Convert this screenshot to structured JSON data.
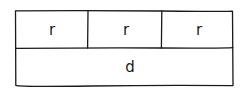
{
  "diagram": {
    "type": "hand-drawn table layout",
    "top_row": {
      "cells": [
        {
          "label": "r"
        },
        {
          "label": "r"
        },
        {
          "label": "r"
        }
      ]
    },
    "bottom_row": {
      "cells": [
        {
          "label": "d"
        }
      ]
    },
    "colors": {
      "stroke": "#1a1a1a",
      "background": "#ffffff"
    }
  }
}
